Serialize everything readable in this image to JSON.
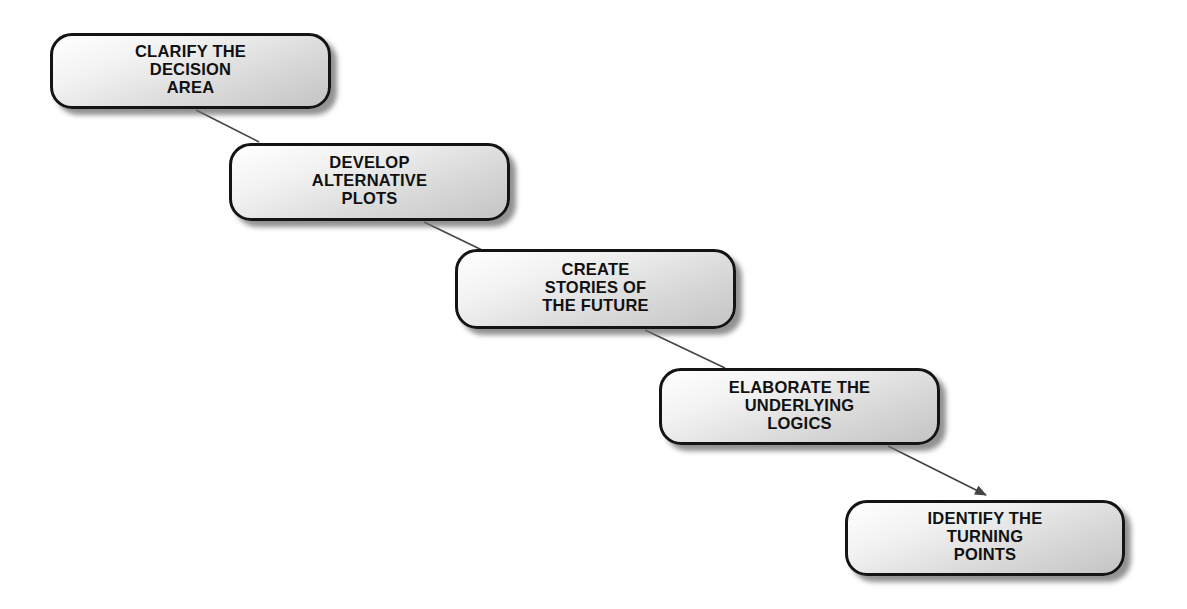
{
  "diagram": {
    "type": "sequential-process-staircase",
    "steps": [
      {
        "id": 1,
        "label": "CLARIFY THE\nDECISION\nAREA",
        "box": {
          "x": 50,
          "y": 33,
          "w": 281,
          "h": 76
        }
      },
      {
        "id": 2,
        "label": "DEVELOP\nALTERNATIVE\nPLOTS",
        "box": {
          "x": 229,
          "y": 143,
          "w": 281,
          "h": 78
        }
      },
      {
        "id": 3,
        "label": "CREATE\nSTORIES OF\nTHE FUTURE",
        "box": {
          "x": 455,
          "y": 249,
          "w": 281,
          "h": 80
        }
      },
      {
        "id": 4,
        "label": "ELABORATE THE\nUNDERLYING\nLOGICS",
        "box": {
          "x": 659,
          "y": 368,
          "w": 281,
          "h": 77
        }
      },
      {
        "id": 5,
        "label": "IDENTIFY THE\nTURNING\nPOINTS",
        "box": {
          "x": 845,
          "y": 500,
          "w": 280,
          "h": 76
        }
      }
    ],
    "connectors": [
      {
        "from": 1,
        "to": 2,
        "x1": 196,
        "y1": 110,
        "x2": 259,
        "y2": 142,
        "arrow": false
      },
      {
        "from": 2,
        "to": 3,
        "x1": 424,
        "y1": 222,
        "x2": 482,
        "y2": 250,
        "arrow": false
      },
      {
        "from": 3,
        "to": 4,
        "x1": 645,
        "y1": 330,
        "x2": 725,
        "y2": 368,
        "arrow": false
      },
      {
        "from": 4,
        "to": 5,
        "x1": 888,
        "y1": 446,
        "x2": 986,
        "y2": 495,
        "arrow": true
      }
    ],
    "colors": {
      "background": "#ffffff",
      "box_border": "#141414",
      "box_fill_light": "#ffffff",
      "box_fill_dark": "#c4c4c4",
      "shadow": "#6e6e6e",
      "connector": "#444444",
      "text": "#111111"
    }
  }
}
